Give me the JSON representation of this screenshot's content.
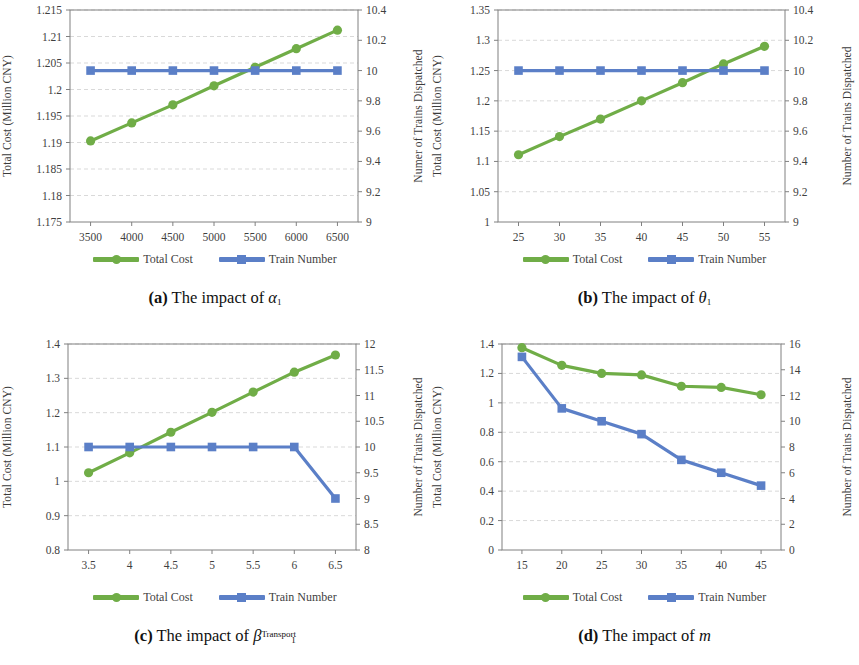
{
  "colors": {
    "total_cost": "#70ad47",
    "train_number": "#5b7fc7",
    "axis": "#808080",
    "grid": "#d9d9d9",
    "text": "#3f3f3f"
  },
  "legend": {
    "total_cost_label": "Total Cost",
    "train_number_label": "Train Number"
  },
  "panels": {
    "a": {
      "caption_letter": "(a)",
      "caption_text": "The impact of",
      "caption_symbol": "α",
      "caption_sub": "1",
      "caption_sup": ""
    },
    "b": {
      "caption_letter": "(b)",
      "caption_text": "The impact of",
      "caption_symbol": "θ",
      "caption_sub": "1",
      "caption_sup": ""
    },
    "c": {
      "caption_letter": "(c)",
      "caption_text": "The impact of",
      "caption_symbol": "β",
      "caption_sub": "1",
      "caption_sup": "Transport"
    },
    "d": {
      "caption_letter": "(d)",
      "caption_text": "The impact of",
      "caption_symbol": "m",
      "caption_sub": "",
      "caption_sup": ""
    }
  },
  "chart_data": [
    {
      "id": "a",
      "type": "line",
      "title": "",
      "xlabel": "",
      "ylabel": "Total Cost (Million CNY)",
      "y2label": "Numer of Trains Dispatched",
      "x": [
        3500,
        4000,
        4500,
        5000,
        5500,
        6000,
        6500
      ],
      "xticks": [
        "3500",
        "4000",
        "4500",
        "5000",
        "5500",
        "6000",
        "6500"
      ],
      "xlim": [
        3250,
        6750
      ],
      "ylim": [
        1.175,
        1.215
      ],
      "yticks": [
        "1.175",
        "1.18",
        "1.185",
        "1.19",
        "1.195",
        "1.2",
        "1.205",
        "1.21",
        "1.215"
      ],
      "y2lim": [
        9,
        10.4
      ],
      "y2ticks": [
        "9",
        "9.2",
        "9.4",
        "9.6",
        "9.8",
        "10",
        "10.2",
        "10.4"
      ],
      "grid": true,
      "legend_position": "below",
      "series": [
        {
          "name": "Total Cost",
          "axis": "left",
          "marker": "circle",
          "values": [
            1.1903,
            1.1937,
            1.1971,
            1.2007,
            1.2042,
            1.2077,
            1.2112
          ]
        },
        {
          "name": "Train Number",
          "axis": "right",
          "marker": "square",
          "values": [
            10,
            10,
            10,
            10,
            10,
            10,
            10
          ]
        }
      ]
    },
    {
      "id": "b",
      "type": "line",
      "title": "",
      "xlabel": "",
      "ylabel": "Total Cost (Million CNY)",
      "y2label": "Number of Trains Dispatched",
      "x": [
        25,
        30,
        35,
        40,
        45,
        50,
        55
      ],
      "xticks": [
        "25",
        "30",
        "35",
        "40",
        "45",
        "50",
        "55"
      ],
      "xlim": [
        22.5,
        57.5
      ],
      "ylim": [
        1.0,
        1.35
      ],
      "yticks": [
        "1",
        "1.05",
        "1.1",
        "1.15",
        "1.2",
        "1.25",
        "1.3",
        "1.35"
      ],
      "y2lim": [
        9,
        10.4
      ],
      "y2ticks": [
        "9",
        "9.2",
        "9.4",
        "9.6",
        "9.8",
        "10",
        "10.2",
        "10.4"
      ],
      "grid": true,
      "legend_position": "below",
      "series": [
        {
          "name": "Total Cost",
          "axis": "left",
          "marker": "circle",
          "values": [
            1.111,
            1.141,
            1.17,
            1.2,
            1.23,
            1.261,
            1.29
          ]
        },
        {
          "name": "Train Number",
          "axis": "right",
          "marker": "square",
          "values": [
            10,
            10,
            10,
            10,
            10,
            10,
            10
          ]
        }
      ]
    },
    {
      "id": "c",
      "type": "line",
      "title": "",
      "xlabel": "",
      "ylabel": "Total Cost (Million CNY)",
      "y2label": "Number of Trains Dispatched",
      "x": [
        3.5,
        4,
        4.5,
        5,
        5.5,
        6,
        6.5
      ],
      "xticks": [
        "3.5",
        "4",
        "4.5",
        "5",
        "5.5",
        "6",
        "6.5"
      ],
      "xlim": [
        3.25,
        6.75
      ],
      "ylim": [
        0.8,
        1.4
      ],
      "yticks": [
        "0.8",
        "0.9",
        "1",
        "1.1",
        "1.2",
        "1.3",
        "1.4"
      ],
      "y2lim": [
        8,
        12
      ],
      "y2ticks": [
        "8",
        "8.5",
        "9",
        "9.5",
        "10",
        "10.5",
        "11",
        "11.5",
        "12"
      ],
      "grid": true,
      "legend_position": "below",
      "series": [
        {
          "name": "Total Cost",
          "axis": "left",
          "marker": "circle",
          "values": [
            1.025,
            1.083,
            1.143,
            1.201,
            1.26,
            1.318,
            1.368
          ]
        },
        {
          "name": "Train Number",
          "axis": "right",
          "marker": "square",
          "values": [
            10,
            10,
            10,
            10,
            10,
            10,
            9
          ]
        }
      ]
    },
    {
      "id": "d",
      "type": "line",
      "title": "",
      "xlabel": "",
      "ylabel": "Total Cost (Million CNY)",
      "y2label": "Number of Trains Dispatched",
      "x": [
        15,
        20,
        25,
        30,
        35,
        40,
        45
      ],
      "xticks": [
        "15",
        "20",
        "25",
        "30",
        "35",
        "40",
        "45"
      ],
      "xlim": [
        12.5,
        47.5
      ],
      "ylim": [
        0,
        1.4
      ],
      "yticks": [
        "0",
        "0.2",
        "0.4",
        "0.6",
        "0.8",
        "1",
        "1.2",
        "1.4"
      ],
      "y2lim": [
        0,
        16
      ],
      "y2ticks": [
        "0",
        "2",
        "4",
        "6",
        "8",
        "10",
        "12",
        "14",
        "16"
      ],
      "grid": true,
      "legend_position": "below",
      "series": [
        {
          "name": "Total Cost",
          "axis": "left",
          "marker": "circle",
          "values": [
            1.375,
            1.255,
            1.2,
            1.19,
            1.113,
            1.105,
            1.055
          ]
        },
        {
          "name": "Train Number",
          "axis": "right",
          "marker": "square",
          "values": [
            15,
            11,
            10,
            9,
            7,
            6,
            5
          ]
        }
      ]
    }
  ]
}
